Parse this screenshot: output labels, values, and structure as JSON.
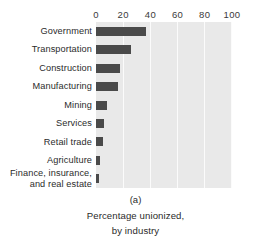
{
  "chart_data": {
    "type": "bar",
    "orientation": "horizontal",
    "title": "",
    "subtitle": "",
    "xlabel": "",
    "ylabel": "",
    "xlim": [
      0,
      100
    ],
    "ylim": null,
    "grid": true,
    "legend": null,
    "categories": [
      "Government",
      "Transportation",
      "Construction",
      "Manufacturing",
      "Mining",
      "Services",
      "Retail trade",
      "Agriculture",
      "Finance, insurance,\nand real estate"
    ],
    "values": [
      37,
      26,
      18,
      16,
      8,
      6,
      5,
      3,
      2
    ],
    "xticks": [
      0,
      20,
      40,
      60,
      80,
      100
    ],
    "xticklabels": [
      "0",
      "20",
      "40",
      "60",
      "80",
      "100"
    ],
    "colors": {
      "bar": "#4a4a4a",
      "plot_background": "#e9e9e9",
      "gridline": "#fbfbfb",
      "text": "#2b2b2b",
      "page_background": "#ffffff"
    }
  },
  "caption": {
    "index": "(a)",
    "line1": "Percentage unionized,",
    "line2": "by industry"
  }
}
